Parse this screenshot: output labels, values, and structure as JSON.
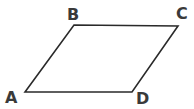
{
  "diagram": {
    "type": "parallelogram",
    "stroke_color": "#2a2a2a",
    "label_color": "#3a3a3a",
    "vertices": [
      {
        "label": "A",
        "x": 25,
        "y": 92
      },
      {
        "label": "B",
        "x": 74,
        "y": 25
      },
      {
        "label": "C",
        "x": 178,
        "y": 26
      },
      {
        "label": "D",
        "x": 132,
        "y": 92
      }
    ]
  }
}
